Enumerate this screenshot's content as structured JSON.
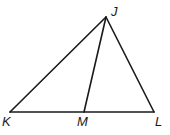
{
  "diagram": {
    "type": "triangle",
    "stroke_color": "#1a1a1a",
    "stroke_width": 1.6,
    "vertices": {
      "J": {
        "label": "J",
        "x": 106,
        "y": 17
      },
      "K": {
        "label": "K",
        "x": 10,
        "y": 112
      },
      "M": {
        "label": "M",
        "x": 84,
        "y": 112
      },
      "L": {
        "label": "L",
        "x": 154,
        "y": 112
      }
    },
    "segments": [
      {
        "name": "JK",
        "from": "J",
        "to": "K"
      },
      {
        "name": "JL",
        "from": "J",
        "to": "L"
      },
      {
        "name": "KL",
        "from": "K",
        "to": "L"
      },
      {
        "name": "JM",
        "from": "J",
        "to": "M"
      }
    ],
    "labels": {
      "J": "J",
      "K": "K",
      "M": "M",
      "L": "L"
    }
  }
}
